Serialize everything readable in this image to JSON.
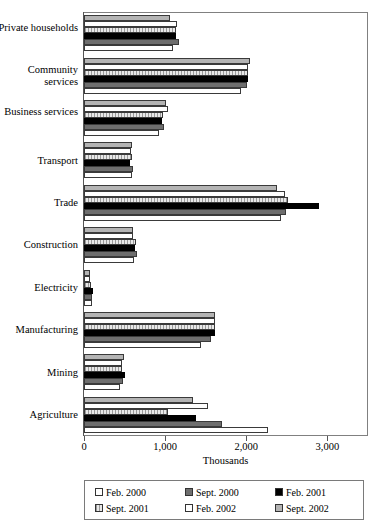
{
  "chart_data": {
    "type": "bar",
    "orientation": "horizontal",
    "title": "",
    "subtitle": "",
    "xlabel": "Thousands",
    "ylabel": "",
    "xlim": [
      0,
      3500
    ],
    "xticks": [
      0,
      1000,
      2000,
      3000
    ],
    "xticklabels": [
      "0",
      "1,000",
      "2,000",
      "3,000"
    ],
    "grid": false,
    "legend_position": "bottom",
    "categories": [
      "Private households",
      "Community services",
      "Business services",
      "Transport",
      "Trade",
      "Construction",
      "Electricity",
      "Manufacturing",
      "Mining",
      "Agriculture"
    ],
    "series": [
      {
        "name": "Feb. 2000",
        "color": "#ffffff",
        "values": [
          1100,
          1940,
          920,
          590,
          2430,
          620,
          95,
          1440,
          440,
          2270
        ]
      },
      {
        "name": "Sept. 2000",
        "color": "#6e6e6e",
        "values": [
          1170,
          2010,
          990,
          600,
          2490,
          650,
          100,
          1560,
          480,
          1700
        ]
      },
      {
        "name": "Feb. 2001",
        "color": "#000000",
        "values": [
          1130,
          2020,
          960,
          570,
          2900,
          630,
          105,
          1620,
          510,
          1380
        ]
      },
      {
        "name": "Sept. 2001",
        "color": "#cfcfcf",
        "values": [
          1130,
          2020,
          970,
          590,
          2510,
          640,
          85,
          1620,
          470,
          1030
        ]
      },
      {
        "name": "Feb. 2002",
        "color": "#ffffff",
        "values": [
          1150,
          2020,
          1030,
          580,
          2480,
          610,
          75,
          1610,
          470,
          1530
        ]
      },
      {
        "name": "Sept. 2002",
        "color": "#b4b4b4",
        "values": [
          1060,
          2050,
          1010,
          590,
          2380,
          600,
          80,
          1620,
          490,
          1340
        ]
      }
    ]
  },
  "legend": {
    "items": [
      {
        "label": "Feb. 2000",
        "key": "feb2000"
      },
      {
        "label": "Sept. 2000",
        "key": "sept2000"
      },
      {
        "label": "Feb. 2001",
        "key": "feb2001"
      },
      {
        "label": "Sept. 2001",
        "key": "sept2001"
      },
      {
        "label": "Feb. 2002",
        "key": "feb2002"
      },
      {
        "label": "Sept. 2002",
        "key": "sept2002"
      }
    ]
  }
}
